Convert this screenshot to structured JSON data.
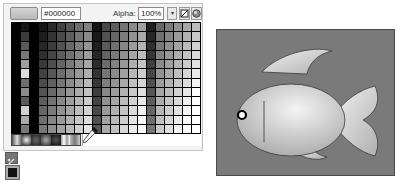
{
  "swatches_panel": {
    "current_color_hex": "#000000",
    "alpha_label": "Alpha:",
    "alpha_value": "100%",
    "alpha_dropdown_icon": "chevron-down-icon",
    "no_color_icon": "no-color-icon",
    "color_wheel_icon": "color-wheel-icon",
    "grid_columns": 21,
    "grid_rows": 12,
    "gradient_swatch_count": 7
  },
  "tools": {
    "stroke_icon": "stroke-color-icon",
    "fill_icon": "fill-color-icon"
  },
  "artwork": {
    "subject": "fish",
    "background_color": "#7a7a7a",
    "fish_fill_light": "#f2f2f2",
    "fish_fill_dark": "#a8a8a8",
    "outline_color": "#3a3a3a"
  }
}
